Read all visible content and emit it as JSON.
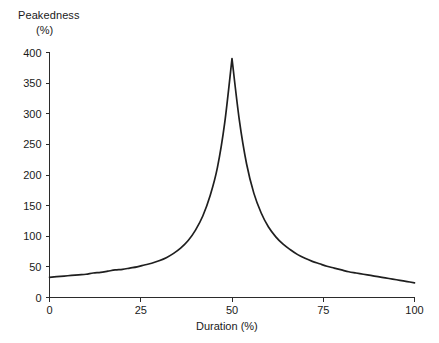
{
  "chart_data": {
    "type": "line",
    "title": "",
    "xlabel": "Duration (%)",
    "ylabel": "Peakedness (%)",
    "ylabel_line1": "Peakedness",
    "ylabel_line2": "(%)",
    "xlim": [
      0,
      100
    ],
    "ylim": [
      0,
      400
    ],
    "grid": false,
    "legend": null,
    "xticks": [
      0,
      25,
      50,
      75,
      100
    ],
    "xtick_labels": [
      "0",
      "25",
      "50",
      "75",
      "100"
    ],
    "yticks": [
      0,
      50,
      100,
      150,
      200,
      250,
      300,
      350,
      400
    ],
    "ytick_labels": [
      "0",
      "50",
      "100",
      "150",
      "200",
      "250",
      "300",
      "350",
      "400"
    ],
    "series": [
      {
        "name": "Peakedness",
        "color": "#1f1f1f",
        "x": [
          0,
          2,
          4,
          6,
          8,
          10,
          12,
          14,
          16,
          18,
          20,
          22,
          24,
          26,
          28,
          30,
          32,
          34,
          36,
          38,
          40,
          42,
          44,
          46,
          48,
          50,
          52,
          54,
          56,
          58,
          60,
          62,
          64,
          66,
          68,
          70,
          72,
          74,
          76,
          78,
          80,
          82,
          84,
          86,
          88,
          90,
          92,
          94,
          96,
          98,
          100
        ],
        "y": [
          33,
          34,
          35,
          36,
          37,
          38,
          40,
          41,
          43,
          45,
          46,
          48,
          50,
          53,
          56,
          60,
          65,
          72,
          81,
          93,
          110,
          133,
          166,
          212,
          285,
          390,
          290,
          218,
          170,
          138,
          115,
          99,
          87,
          78,
          70,
          64,
          59,
          55,
          51,
          48,
          45,
          42,
          40,
          38,
          36,
          34,
          32,
          30,
          28,
          26,
          24
        ]
      }
    ],
    "annotations": {
      "peak_x": 50,
      "peak_y": 390,
      "left_tail_y": 33,
      "right_tail_y": 24
    },
    "axis_colors": {
      "axis": "#2b2b2b",
      "curve": "#1f1f1f",
      "background": "#ffffff"
    }
  }
}
